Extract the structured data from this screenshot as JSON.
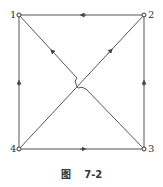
{
  "figure": {
    "caption_prefix": "图",
    "caption_number": "7-2",
    "line_color": "#555555"
  },
  "nodes": [
    {
      "id": "1",
      "label": "1",
      "x": 19,
      "y": 15
    },
    {
      "id": "2",
      "label": "2",
      "x": 144,
      "y": 15
    },
    {
      "id": "3",
      "label": "3",
      "x": 144,
      "y": 149
    },
    {
      "id": "4",
      "label": "4",
      "x": 19,
      "y": 149
    }
  ],
  "edges": [
    {
      "from": "2",
      "to": "1",
      "note": "top edge, arrow pointing left"
    },
    {
      "from": "3",
      "to": "2",
      "note": "right edge, arrow pointing up"
    },
    {
      "from": "4",
      "to": "3",
      "note": "bottom edge, arrow pointing right"
    },
    {
      "from": "4",
      "to": "1",
      "note": "left edge, arrow pointing up"
    },
    {
      "from": "3",
      "to": "1",
      "note": "diagonal with crossover hop at center"
    },
    {
      "from": "4",
      "to": "2",
      "note": "diagonal"
    }
  ]
}
